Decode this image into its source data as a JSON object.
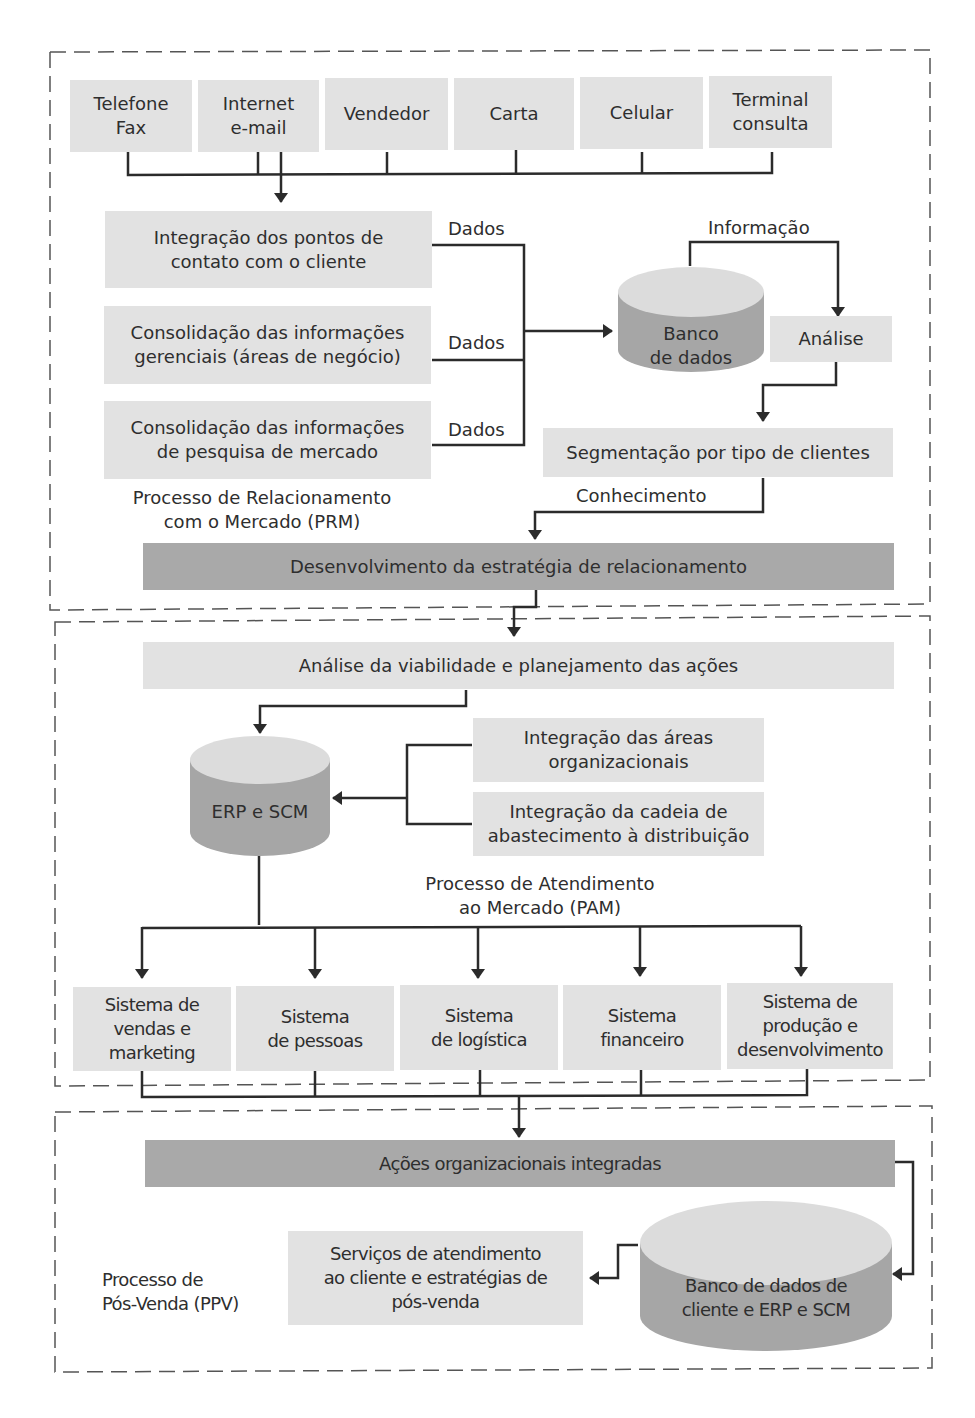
{
  "colors": {
    "box_light": "#e2e2e2",
    "box_dark": "#a9a9a9",
    "cylinder_top": "#dcdcdc",
    "cylinder_body": "#a6a6a6",
    "line": "#2b2b2b",
    "dashed_border": "#555555"
  },
  "prm": {
    "section_label": [
      "Processo de Relacionamento",
      "com o Mercado (PRM)"
    ],
    "channels": [
      {
        "line1": "Telefone",
        "line2": "Fax"
      },
      {
        "line1": "Internet",
        "line2": "e-mail"
      },
      {
        "line1": "Vendedor",
        "line2": ""
      },
      {
        "line1": "Carta",
        "line2": ""
      },
      {
        "line1": "Celular",
        "line2": ""
      },
      {
        "line1": "Terminal",
        "line2": "consulta"
      }
    ],
    "sources": [
      {
        "line1": "Integração dos pontos de",
        "line2": "contato com o cliente",
        "flow_label": "Dados"
      },
      {
        "line1": "Consolidação das informações",
        "line2": "gerenciais (áreas de negócio)",
        "flow_label": "Dados"
      },
      {
        "line1": "Consolidação das informações",
        "line2": "de pesquisa de mercado",
        "flow_label": "Dados"
      }
    ],
    "database": {
      "line1": "Banco",
      "line2": "de dados"
    },
    "info_label": "Informação",
    "analysis": "Análise",
    "segmentation": "Segmentação por tipo de clientes",
    "knowledge_label": "Conhecimento",
    "strategy": "Desenvolvimento da estratégia de relacionamento"
  },
  "pam": {
    "section_label": [
      "Processo de Atendimento",
      "ao Mercado (PAM)"
    ],
    "planning": "Análise da viabilidade e planejamento das ações",
    "erp": "ERP e SCM",
    "integrations": [
      {
        "line1": "Integração das áreas",
        "line2": "organizacionais"
      },
      {
        "line1": "Integração da cadeia de",
        "line2": "abastecimento à distribuição"
      }
    ],
    "systems": [
      {
        "lines": [
          "Sistema de",
          "vendas e",
          "marketing"
        ]
      },
      {
        "lines": [
          "Sistema",
          "de pessoas"
        ]
      },
      {
        "lines": [
          "Sistema",
          "de logística"
        ]
      },
      {
        "lines": [
          "Sistema",
          "financeiro"
        ]
      },
      {
        "lines": [
          "Sistema de",
          "produção e",
          "desenvolvimento"
        ]
      }
    ]
  },
  "ppv": {
    "section_label": [
      "Processo de",
      "Pós-Venda (PPV)"
    ],
    "integrated_actions": "Ações organizacionais integradas",
    "services": [
      "Serviços de atendimento",
      "ao cliente e estratégias de",
      "pós-venda"
    ],
    "database": {
      "line1": "Banco de dados de",
      "line2": "cliente e ERP e SCM"
    }
  }
}
